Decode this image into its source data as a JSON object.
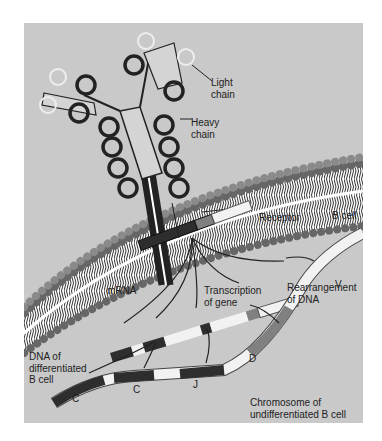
{
  "figure": {
    "labels": {
      "light_chain": [
        "Light",
        "chain"
      ],
      "heavy_chain": [
        "Heavy",
        "chain"
      ],
      "receptor": "Receptor",
      "b_cell": "B cell",
      "mrna": "mRNA",
      "transcription": [
        "Transcription",
        "of gene"
      ],
      "rearrangement": [
        "Rearrangement",
        "of DNA"
      ],
      "dna_differentiated": [
        "DNA of",
        "differentiated",
        "B cell"
      ],
      "segment_c1": "C",
      "segment_c2": "C",
      "segment_j": "J",
      "segment_d": "D",
      "segment_v": "V",
      "chromosome": [
        "Chromosome of",
        "undifferentiated B cell"
      ]
    },
    "colors": {
      "background": "#c9c9c9",
      "dark_segment": "#2e2e2e",
      "mid_segment": "#808080",
      "light_segment": "#f2f2f2",
      "membrane_head": "#7a7a7a"
    }
  }
}
